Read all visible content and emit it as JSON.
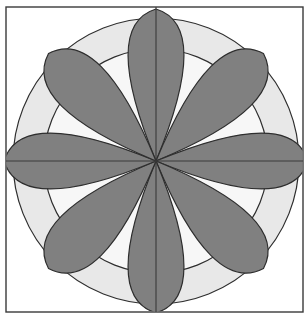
{
  "figure": {
    "type": "geometric-pattern",
    "canvas": {
      "width": 306,
      "height": 322,
      "background": "#ffffff"
    }
  },
  "palette": {
    "background": "#ffffff",
    "frame_stroke": "#3a3a3a",
    "outline_stroke": "#2e2e2e",
    "dark_gray_petal": "#808080",
    "light_gray_ring": "#e8e8e8",
    "near_white_field": "#f7f7f7",
    "center_line": "#3a3a3a"
  },
  "geometry": {
    "frame": {
      "x": 6,
      "y": 7,
      "width": 297,
      "height": 305,
      "stroke_width": 1.4
    },
    "center": {
      "x": 156,
      "y": 161
    },
    "outer_circle_radius": 143,
    "ring_inner_radius": 112,
    "petal_count": 8,
    "petal_arc_bulge": 0.62,
    "axis_lines": [
      {
        "name": "vertical-axis",
        "x1": 156,
        "y1": 7,
        "x2": 156,
        "y2": 312
      },
      {
        "name": "horizontal-axis",
        "x1": 6,
        "y1": 161,
        "x2": 303,
        "y2": 161
      }
    ],
    "notch_tips": {
      "top": {
        "x": 156,
        "y": 51
      },
      "bottom": {
        "x": 156,
        "y": 271
      },
      "left": {
        "x": 41,
        "y": 161
      },
      "right": {
        "x": 271,
        "y": 161
      }
    },
    "petal_tip_radius": 152,
    "petal_half_angle_deg": 22.5
  },
  "labels": {
    "figure_caption": "",
    "legend": []
  },
  "chart_data": {
    "type": "pie",
    "categories": [
      "Petal N",
      "Petal NE",
      "Petal E",
      "Petal SE",
      "Petal S",
      "Petal SW",
      "Petal W",
      "Petal NW"
    ],
    "values": [
      45,
      45,
      45,
      45,
      45,
      45,
      45,
      45
    ],
    "series": [
      {
        "name": "dark-petals",
        "values": [
          45,
          45,
          45,
          45,
          45,
          45,
          45,
          45
        ]
      }
    ],
    "xlabel": "",
    "ylabel": "",
    "legend_position": "none",
    "grid": false
  }
}
